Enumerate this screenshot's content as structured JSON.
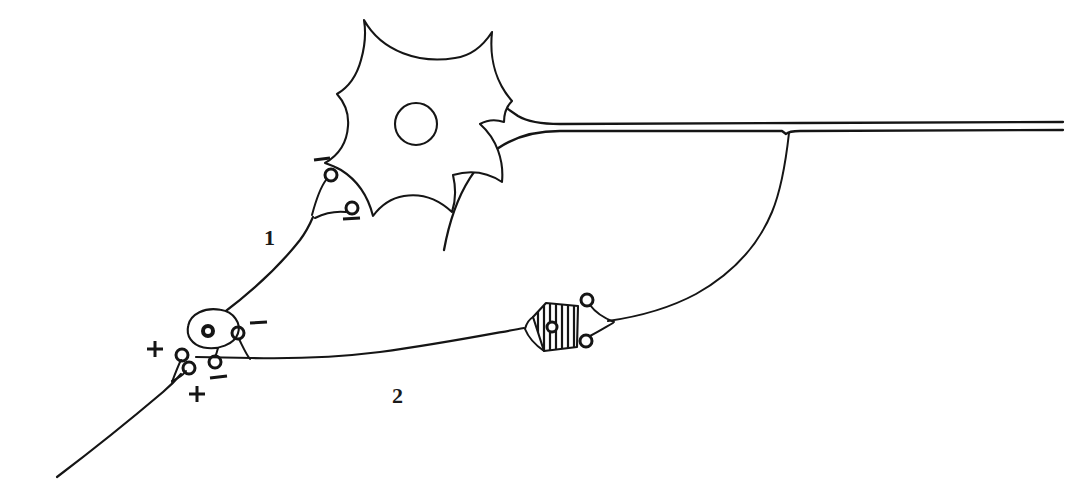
{
  "figure": {
    "background_color": "#ffffff",
    "ink_color": "#151515",
    "width": 1066,
    "height": 494
  },
  "labels": [
    {
      "name": "pathway-label-1",
      "text": "1",
      "x": 264,
      "y": 245
    },
    {
      "name": "pathway-label-2",
      "text": "2",
      "x": 392,
      "y": 403
    }
  ],
  "cells": [
    {
      "name": "principal-neuron-soma",
      "shape": "star-multipolar",
      "description": "Large stellate cell body with six pointed dendritic stubs and concave borders",
      "nucleus": {
        "cx": 416,
        "cy": 124,
        "r": 21
      }
    },
    {
      "name": "interneuron-oval-soma",
      "shape": "oval",
      "description": "Small tilted oval cell body with dark nucleus, lower-left of figure",
      "nucleus": {
        "cx": 208,
        "cy": 331,
        "r": 5
      }
    },
    {
      "name": "interneuron-hatched-soma",
      "shape": "hatched-pentagon",
      "description": "Pentagonal cell body filled with vertical hatching, with small nucleus",
      "nucleus": {
        "cx": 552,
        "cy": 327,
        "r": 5
      }
    }
  ],
  "synapses": [
    {
      "name": "synapse-excitatory-1",
      "sign": "+",
      "polarity": "excitatory",
      "sign_x": 155,
      "sign_y": 349,
      "target": "interneuron-oval-soma"
    },
    {
      "name": "synapse-excitatory-2",
      "sign": "+",
      "polarity": "excitatory",
      "sign_x": 197,
      "sign_y": 394,
      "target": "interneuron-oval-soma"
    },
    {
      "name": "synapse-inhibitory-1",
      "sign": "−",
      "polarity": "inhibitory",
      "sign_x": 258,
      "sign_y": 323,
      "target": "principal-neuron-dendrite"
    },
    {
      "name": "synapse-inhibitory-2",
      "sign": "−",
      "polarity": "inhibitory",
      "sign_x": 219,
      "sign_y": 377,
      "target": "pathway-2"
    },
    {
      "name": "synapse-inhibitory-3",
      "sign": "−",
      "polarity": "inhibitory",
      "sign_x": 322,
      "sign_y": 160,
      "target": "principal-neuron-soma"
    },
    {
      "name": "synapse-inhibitory-4",
      "sign": "−",
      "polarity": "inhibitory",
      "sign_x": 351,
      "sign_y": 218,
      "target": "principal-neuron-soma"
    }
  ],
  "processes": [
    {
      "name": "afferent-axon-input",
      "description": "Incoming afferent fibre from lower-left ending in two excitatory boutons"
    },
    {
      "name": "pathway-1-dendrite",
      "description": "Pathway 1: ascending fibre from oval interneuron to principal neuron soma, labelled 1"
    },
    {
      "name": "pathway-2-collateral",
      "description": "Pathway 2: horizontal fibre running right from oval interneuron past hatched cell, labelled 2"
    },
    {
      "name": "principal-axon",
      "description": "Thick myelinated axon drawn as two parallel lines exiting to the right edge"
    },
    {
      "name": "recurrent-collateral",
      "description": "Recurrent axon collateral branching downward-left to the hatched interneuron"
    }
  ],
  "counts": {
    "cells": 3,
    "excitatory_synapses": 2,
    "inhibitory_synapses": 4,
    "numbered_pathways": 2
  }
}
